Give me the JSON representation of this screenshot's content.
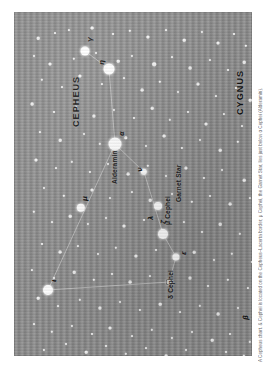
{
  "figure": {
    "kind": "star-chart",
    "orientation": "rotated-90-ccw",
    "background_color": "#8e8e8e",
    "star_color": "#ffffff",
    "line_color": "#d9d9d9",
    "text_color": "#111111",
    "caption": "A Cepheus chart. & Cephei is located on the Cepheus–Lacerta border; μ Cephei, the Garnet Star, lies just below α Cephei (Alderamin)."
  },
  "constellations": [
    {
      "id": "cepheus",
      "label": "CEPHEUS",
      "x": 57,
      "y": 115
    },
    {
      "id": "cygnus",
      "label": "CYGNUS",
      "x": 221,
      "y": 103
    },
    {
      "id": "lacerta",
      "label": "LACERTA",
      "x": 242,
      "y": 327
    }
  ],
  "star_labels": [
    {
      "id": "alderamin",
      "label": "Alderamin",
      "x": 97,
      "y": 172,
      "kind": "name"
    },
    {
      "id": "mu-cephei",
      "label": "μ Cephei",
      "x": 150,
      "y": 213,
      "kind": "name"
    },
    {
      "id": "garnet-star",
      "label": "Garnet Star",
      "x": 161,
      "y": 190,
      "kind": "name"
    },
    {
      "id": "delta-cephei",
      "label": "δ Cephei",
      "x": 153,
      "y": 287,
      "kind": "name"
    },
    {
      "id": "alpha",
      "label": "α",
      "x": 104,
      "y": 124,
      "kind": "greek"
    },
    {
      "id": "gamma",
      "label": "γ",
      "x": 72,
      "y": 30,
      "kind": "greek"
    },
    {
      "id": "eta-top",
      "label": "η",
      "x": 84,
      "y": 53,
      "kind": "greek"
    },
    {
      "id": "nu",
      "label": "ν",
      "x": 122,
      "y": 160,
      "kind": "greek"
    },
    {
      "id": "mu-sym",
      "label": "μ",
      "x": 67,
      "y": 189,
      "kind": "greek"
    },
    {
      "id": "lambda",
      "label": "λ",
      "x": 133,
      "y": 208,
      "kind": "greek"
    },
    {
      "id": "zeta",
      "label": "ζ",
      "x": 146,
      "y": 212,
      "kind": "greek"
    },
    {
      "id": "epsilon",
      "label": "ε",
      "x": 166,
      "y": 243,
      "kind": "greek"
    },
    {
      "id": "iota",
      "label": "ι",
      "x": 36,
      "y": 270,
      "kind": "greek"
    },
    {
      "id": "beta-lac",
      "label": "β",
      "x": 228,
      "y": 308,
      "kind": "greek"
    }
  ],
  "named_stars": [
    {
      "id": "alpha-cephei",
      "x": 101,
      "y": 132,
      "r": 6.5
    },
    {
      "id": "gamma-cephei",
      "x": 71,
      "y": 39,
      "r": 4.5
    },
    {
      "id": "eta-cephei",
      "x": 95,
      "y": 57,
      "r": 5.5
    },
    {
      "id": "nu-cephei",
      "x": 130,
      "y": 160,
      "r": 3.2
    },
    {
      "id": "mu-cephei",
      "x": 144,
      "y": 194,
      "r": 4.0
    },
    {
      "id": "mu-symbol-star",
      "x": 67,
      "y": 196,
      "r": 4.2
    },
    {
      "id": "zeta-cephei",
      "x": 149,
      "y": 222,
      "r": 5.0
    },
    {
      "id": "epsilon-cephei",
      "x": 162,
      "y": 245,
      "r": 3.6
    },
    {
      "id": "delta-cephei",
      "x": 155,
      "y": 270,
      "r": 3.4,
      "variable": true
    },
    {
      "id": "iota-cephei",
      "x": 34,
      "y": 278,
      "r": 5.0
    }
  ],
  "lines": [
    {
      "from": "gamma-cephei",
      "to": "eta-cephei"
    },
    {
      "from": "eta-cephei",
      "to": "alpha-cephei"
    },
    {
      "from": "alpha-cephei",
      "to": "nu-cephei"
    },
    {
      "from": "nu-cephei",
      "to": "zeta-cephei"
    },
    {
      "from": "zeta-cephei",
      "to": "epsilon-cephei"
    },
    {
      "from": "epsilon-cephei",
      "to": "delta-cephei"
    },
    {
      "from": "delta-cephei",
      "to": "iota-cephei"
    },
    {
      "from": "iota-cephei",
      "to": "alpha-cephei"
    }
  ],
  "field_stars": [
    [
      24,
      26,
      1.3
    ],
    [
      41,
      21,
      1.0
    ],
    [
      55,
      18,
      1.1
    ],
    [
      78,
      16,
      1.4
    ],
    [
      99,
      22,
      1.0
    ],
    [
      116,
      19,
      1.2
    ],
    [
      134,
      25,
      1.6
    ],
    [
      152,
      18,
      1.0
    ],
    [
      170,
      28,
      1.3
    ],
    [
      188,
      20,
      1.1
    ],
    [
      204,
      31,
      1.5
    ],
    [
      220,
      22,
      1.0
    ],
    [
      232,
      34,
      1.2
    ],
    [
      20,
      44,
      1.0
    ],
    [
      36,
      52,
      1.5
    ],
    [
      60,
      47,
      1.2
    ],
    [
      82,
      41,
      1.0
    ],
    [
      104,
      49,
      1.3
    ],
    [
      118,
      44,
      1.1
    ],
    [
      140,
      52,
      1.8
    ],
    [
      158,
      45,
      1.0
    ],
    [
      176,
      56,
      1.4
    ],
    [
      196,
      48,
      1.1
    ],
    [
      214,
      58,
      1.0
    ],
    [
      230,
      50,
      1.3
    ],
    [
      28,
      68,
      1.2
    ],
    [
      48,
      75,
      1.0
    ],
    [
      66,
      64,
      1.6
    ],
    [
      88,
      72,
      1.1
    ],
    [
      110,
      66,
      1.0
    ],
    [
      128,
      78,
      1.4
    ],
    [
      146,
      70,
      1.2
    ],
    [
      164,
      80,
      1.0
    ],
    [
      184,
      72,
      1.5
    ],
    [
      202,
      84,
      1.1
    ],
    [
      222,
      76,
      1.0
    ],
    [
      236,
      88,
      1.3
    ],
    [
      18,
      92,
      1.4
    ],
    [
      40,
      100,
      1.0
    ],
    [
      62,
      95,
      1.2
    ],
    [
      80,
      104,
      1.6
    ],
    [
      100,
      98,
      1.1
    ],
    [
      120,
      106,
      1.0
    ],
    [
      138,
      96,
      1.3
    ],
    [
      156,
      108,
      1.2
    ],
    [
      174,
      100,
      1.0
    ],
    [
      192,
      112,
      1.5
    ],
    [
      210,
      102,
      1.1
    ],
    [
      228,
      114,
      1.0
    ],
    [
      26,
      120,
      1.1
    ],
    [
      46,
      128,
      1.3
    ],
    [
      70,
      122,
      1.0
    ],
    [
      86,
      132,
      1.2
    ],
    [
      112,
      126,
      1.7
    ],
    [
      132,
      134,
      1.0
    ],
    [
      150,
      124,
      1.4
    ],
    [
      168,
      136,
      1.1
    ],
    [
      186,
      128,
      1.0
    ],
    [
      206,
      138,
      1.3
    ],
    [
      224,
      130,
      1.2
    ],
    [
      240,
      140,
      1.0
    ],
    [
      22,
      148,
      1.5
    ],
    [
      42,
      156,
      1.0
    ],
    [
      58,
      150,
      1.2
    ],
    [
      76,
      160,
      1.1
    ],
    [
      94,
      152,
      1.0
    ],
    [
      114,
      162,
      1.4
    ],
    [
      134,
      154,
      1.2
    ],
    [
      152,
      164,
      1.0
    ],
    [
      172,
      156,
      1.6
    ],
    [
      190,
      166,
      1.1
    ],
    [
      208,
      158,
      1.0
    ],
    [
      230,
      168,
      1.3
    ],
    [
      30,
      176,
      1.0
    ],
    [
      50,
      184,
      1.2
    ],
    [
      78,
      178,
      1.5
    ],
    [
      96,
      186,
      1.0
    ],
    [
      118,
      180,
      1.1
    ],
    [
      136,
      188,
      1.3
    ],
    [
      158,
      182,
      1.0
    ],
    [
      178,
      190,
      1.2
    ],
    [
      196,
      184,
      1.0
    ],
    [
      216,
      192,
      1.4
    ],
    [
      236,
      186,
      1.1
    ],
    [
      20,
      200,
      1.2
    ],
    [
      38,
      210,
      1.0
    ],
    [
      56,
      204,
      1.3
    ],
    [
      74,
      212,
      1.1
    ],
    [
      92,
      206,
      1.0
    ],
    [
      110,
      214,
      1.5
    ],
    [
      130,
      208,
      1.0
    ],
    [
      148,
      218,
      1.2
    ],
    [
      170,
      210,
      1.1
    ],
    [
      188,
      220,
      1.0
    ],
    [
      206,
      212,
      1.3
    ],
    [
      226,
      222,
      1.2
    ],
    [
      28,
      232,
      1.0
    ],
    [
      46,
      240,
      1.4
    ],
    [
      64,
      234,
      1.1
    ],
    [
      84,
      242,
      1.0
    ],
    [
      102,
      236,
      1.2
    ],
    [
      122,
      244,
      1.6
    ],
    [
      142,
      238,
      1.0
    ],
    [
      162,
      246,
      1.1
    ],
    [
      180,
      240,
      1.3
    ],
    [
      200,
      248,
      1.0
    ],
    [
      218,
      242,
      1.2
    ],
    [
      238,
      250,
      1.0
    ],
    [
      18,
      258,
      1.1
    ],
    [
      40,
      266,
      1.0
    ],
    [
      60,
      260,
      1.3
    ],
    [
      80,
      268,
      1.2
    ],
    [
      98,
      262,
      1.0
    ],
    [
      116,
      270,
      1.4
    ],
    [
      136,
      264,
      1.1
    ],
    [
      156,
      272,
      1.0
    ],
    [
      176,
      266,
      1.5
    ],
    [
      194,
      274,
      1.0
    ],
    [
      214,
      268,
      1.2
    ],
    [
      234,
      276,
      1.1
    ],
    [
      24,
      286,
      1.3
    ],
    [
      44,
      294,
      1.0
    ],
    [
      66,
      288,
      1.2
    ],
    [
      86,
      296,
      1.6
    ],
    [
      106,
      290,
      1.0
    ],
    [
      126,
      298,
      1.1
    ],
    [
      146,
      292,
      1.3
    ],
    [
      166,
      300,
      1.0
    ],
    [
      186,
      294,
      1.2
    ],
    [
      204,
      302,
      1.4
    ],
    [
      224,
      296,
      1.0
    ],
    [
      242,
      304,
      1.1
    ],
    [
      20,
      312,
      1.0
    ],
    [
      38,
      320,
      1.2
    ],
    [
      58,
      314,
      1.1
    ],
    [
      78,
      322,
      1.0
    ],
    [
      96,
      316,
      1.5
    ],
    [
      118,
      324,
      1.0
    ],
    [
      138,
      318,
      1.2
    ],
    [
      158,
      326,
      1.1
    ],
    [
      178,
      320,
      1.0
    ],
    [
      198,
      328,
      1.3
    ],
    [
      216,
      322,
      1.0
    ],
    [
      236,
      330,
      1.2
    ],
    [
      30,
      338,
      1.1
    ],
    [
      52,
      332,
      1.0
    ],
    [
      72,
      340,
      1.3
    ],
    [
      92,
      334,
      1.0
    ],
    [
      112,
      342,
      1.2
    ],
    [
      132,
      336,
      1.0
    ],
    [
      152,
      344,
      1.4
    ],
    [
      172,
      338,
      1.0
    ],
    [
      192,
      346,
      1.1
    ],
    [
      212,
      340,
      1.0
    ],
    [
      230,
      344,
      1.2
    ]
  ]
}
